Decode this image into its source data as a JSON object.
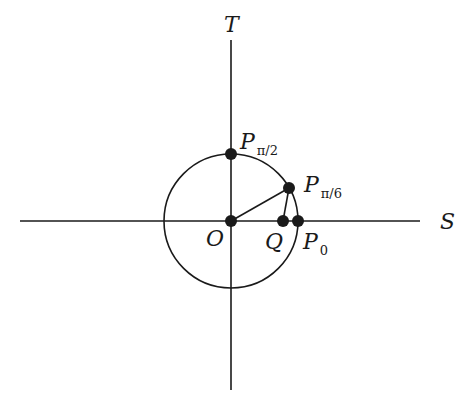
{
  "figure": {
    "axes": {
      "horizontal_label": "S",
      "vertical_label": "T"
    },
    "points": {
      "origin": {
        "label": "O"
      },
      "p_pi_2": {
        "label": "P",
        "subscript": "π/2"
      },
      "p_pi_6": {
        "label": "P",
        "subscript": "π/6"
      },
      "q": {
        "label": "Q"
      },
      "p_0": {
        "label": "P",
        "subscript": "0"
      }
    },
    "colors": {
      "stroke": "#1a1a1a",
      "background": "#ffffff"
    }
  }
}
